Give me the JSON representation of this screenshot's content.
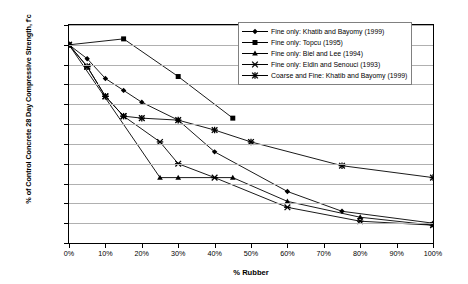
{
  "chart_data": {
    "type": "line",
    "title": "",
    "xlabel": "% Rubber",
    "ylabel": "% of Control Concrete 28 Day Compressive Strength, f'c",
    "xlim": [
      0,
      100
    ],
    "ylim": [
      0,
      110
    ],
    "xticks": [
      "0%",
      "10%",
      "20%",
      "30%",
      "40%",
      "50%",
      "60%",
      "70%",
      "80%",
      "90%",
      "100%"
    ],
    "yticks": [
      "0%",
      "10%",
      "20%",
      "30%",
      "40%",
      "50%",
      "60%",
      "70%",
      "80%",
      "90%",
      "100%",
      "110%"
    ],
    "grid": "horizontal",
    "legend_position": "top-right",
    "series": [
      {
        "name": "Fine only: Khatib and Bayomy (1999)",
        "marker": "diamond",
        "x": [
          0,
          5,
          10,
          15,
          20,
          30,
          40,
          60,
          75,
          100
        ],
        "y": [
          100,
          93,
          83,
          77,
          71,
          62,
          46,
          26,
          16,
          10
        ]
      },
      {
        "name": "Fine only: Topcu (1995)",
        "marker": "square",
        "x": [
          0,
          15,
          30,
          45
        ],
        "y": [
          100,
          103,
          84,
          63
        ]
      },
      {
        "name": "Fine only: Biel and Lee (1994)",
        "marker": "triangle",
        "x": [
          0,
          25,
          30,
          45,
          60,
          80,
          100
        ],
        "y": [
          100,
          33,
          33,
          33,
          21,
          13,
          9
        ]
      },
      {
        "name": "Fine only: Eldin and Senouci (1993)",
        "marker": "cross",
        "x": [
          0,
          5,
          10,
          15,
          25,
          30,
          40,
          60,
          80,
          100
        ],
        "y": [
          100,
          89,
          74,
          64,
          51,
          40,
          33,
          18,
          11,
          9
        ]
      },
      {
        "name": "Coarse and Fine: Khatib and Bayomy (1999)",
        "marker": "star",
        "x": [
          0,
          5,
          10,
          15,
          20,
          30,
          40,
          50,
          75,
          100
        ],
        "y": [
          100,
          89,
          74,
          64,
          63,
          62,
          57,
          51,
          39,
          33
        ]
      }
    ]
  },
  "axes": {
    "y_title": "% of Control Concrete 28 Day Compressive Strength, f'c",
    "x_title": "% Rubber"
  },
  "legend": {
    "items": [
      {
        "label": "Fine only: Khatib and Bayomy (1999)",
        "marker": "diamond-marker"
      },
      {
        "label": "Fine only: Topcu (1995)",
        "marker": "square-marker"
      },
      {
        "label": "Fine only: Biel and Lee (1994)",
        "marker": "triangle-marker"
      },
      {
        "label": "Fine only: Eldin and Senouci (1993)",
        "marker": "cross-marker"
      },
      {
        "label": "Coarse and Fine: Khatib and Bayomy (1999)",
        "marker": "star-marker"
      }
    ]
  },
  "colors": {
    "line": "#000000",
    "grid": "#b0b0b0",
    "axis": "#000000",
    "background": "#ffffff"
  }
}
